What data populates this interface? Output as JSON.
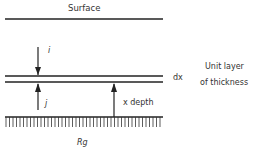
{
  "diagram": {
    "surface_label": "Surface",
    "downward_flux_label": "i",
    "upward_flux_label": "j",
    "layer_thickness_label": "dx",
    "depth_label": "x depth",
    "unit_layer_label_line1": "Unit layer",
    "unit_layer_label_line2": "of thickness",
    "ground_reflectance_label": "Rg",
    "line_color": "#222222"
  }
}
